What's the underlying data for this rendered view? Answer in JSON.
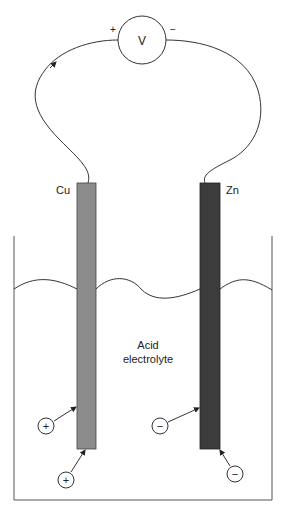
{
  "diagram": {
    "voltmeter": {
      "symbol": "V",
      "positive_terminal": "+",
      "negative_terminal": "−"
    },
    "electrodes": [
      {
        "label": "Cu",
        "color": "#8c8c8c",
        "charge": "+"
      },
      {
        "label": "Zn",
        "color": "#3c3c3c",
        "charge": "−"
      }
    ],
    "electrolyte": {
      "line1": "Acid",
      "line2": "electrolyte"
    },
    "ions": [
      {
        "sign": "+",
        "target": "Cu side"
      },
      {
        "sign": "+",
        "target": "Cu bottom"
      },
      {
        "sign": "−",
        "target": "Zn side"
      },
      {
        "sign": "−",
        "target": "Zn bottom"
      }
    ]
  }
}
